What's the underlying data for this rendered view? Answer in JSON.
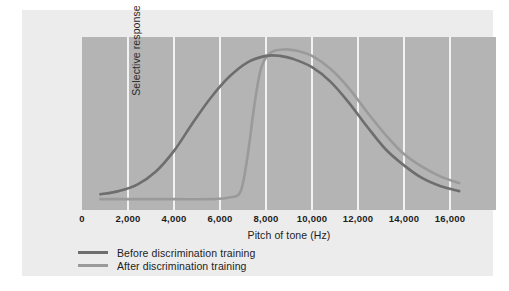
{
  "chart_data": {
    "type": "line",
    "title": "",
    "xlabel": "Pitch of tone (Hz)",
    "ylabel": "Selective response",
    "xlim": [
      0,
      18000
    ],
    "ylim": [
      0,
      100
    ],
    "grid": "vertical white gridlines every 2,000 Hz",
    "legend_position": "below-axis-left",
    "xticks": [
      "0",
      "2,000",
      "4,000",
      "6,000",
      "8,000",
      "10,000",
      "12,000",
      "14,000",
      "16,000"
    ],
    "xtick_values": [
      0,
      2000,
      4000,
      6000,
      8000,
      10000,
      12000,
      14000,
      16000
    ],
    "yticks": [],
    "colors": {
      "plot_background": "#b4b4b4",
      "card_background": "#ececec",
      "page_background": "#ffffff",
      "gridline": "#f2f2f2",
      "before_curve": "#6e6e6e",
      "after_curve": "#9a9a9a"
    },
    "series": [
      {
        "name": "Before discrimination training",
        "color": "#6e6e6e",
        "x": [
          800,
          1600,
          2400,
          3200,
          4000,
          4800,
          5600,
          6400,
          7200,
          8000,
          8600,
          9200,
          10000,
          10800,
          11600,
          12400,
          13200,
          14000,
          14800,
          15600,
          16400
        ],
        "values": [
          6,
          8,
          12,
          20,
          33,
          50,
          66,
          79,
          88,
          92,
          92,
          90,
          85,
          76,
          63,
          48,
          34,
          24,
          16,
          11,
          8
        ]
      },
      {
        "name": "After discrimination training",
        "color": "#9a9a9a",
        "x": [
          800,
          2400,
          4000,
          5600,
          6400,
          6900,
          7200,
          7500,
          7800,
          8200,
          8800,
          9400,
          10000,
          10800,
          11600,
          12400,
          13200,
          14000,
          14800,
          15600,
          16400
        ],
        "values": [
          3,
          3,
          3,
          3,
          4,
          8,
          30,
          62,
          85,
          94,
          96,
          95,
          92,
          84,
          72,
          57,
          43,
          31,
          23,
          17,
          13
        ]
      }
    ]
  },
  "axes": {
    "y_label": "Selective response",
    "x_label": "Pitch of tone (Hz)",
    "x_ticks": [
      {
        "label": "0",
        "value": 0
      },
      {
        "label": "2,000",
        "value": 2000
      },
      {
        "label": "4,000",
        "value": 4000
      },
      {
        "label": "6,000",
        "value": 6000
      },
      {
        "label": "8,000",
        "value": 8000
      },
      {
        "label": "10,000",
        "value": 10000
      },
      {
        "label": "12,000",
        "value": 12000
      },
      {
        "label": "14,000",
        "value": 14000
      },
      {
        "label": "16,000",
        "value": 16000
      }
    ]
  },
  "legend": {
    "items": [
      {
        "label": "Before discrimination training",
        "color": "#6e6e6e"
      },
      {
        "label": "After discrimination training",
        "color": "#9a9a9a"
      }
    ]
  }
}
